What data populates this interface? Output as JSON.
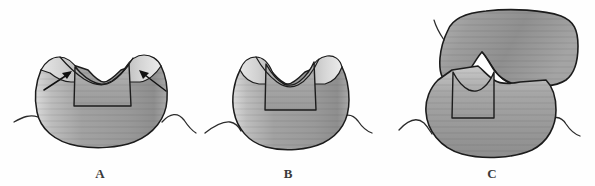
{
  "figure": {
    "background_color": "#fefefe",
    "width": 595,
    "height": 186,
    "style": "grayscale scanned line drawing"
  },
  "colors": {
    "outline": "#1c1c1c",
    "tooth_mid_gray": "#9a9a9a",
    "tooth_light_gray": "#d6d6d6",
    "tooth_dark_gray": "#7d7d7d",
    "prep_floor_gray": "#a8a8a8",
    "label_color": "#3a3a3a",
    "arrow_color": "#111111",
    "gingiva_line": "#2a2a2a"
  },
  "panels": [
    {
      "id": "panel-a",
      "label": "A",
      "label_x": 100,
      "label_y": 178,
      "caption": "Tooth with occlusal box preparation; arrows indicate remaining unsupported cusps",
      "arrows": [
        {
          "name": "left-cusp-arrow",
          "direction": "up-right",
          "tail_x": 44,
          "tail_y": 90,
          "tip_x": 72,
          "tip_y": 72
        },
        {
          "name": "right-cusp-arrow",
          "direction": "up-left",
          "tail_x": 165,
          "tail_y": 90,
          "tip_x": 139,
          "tip_y": 70
        }
      ],
      "has_gingiva": true
    },
    {
      "id": "panel-b",
      "label": "B",
      "label_x": 288,
      "label_y": 178,
      "caption": "Narrowed preparation with reduced cusps",
      "arrows": [],
      "has_gingiva": true
    },
    {
      "id": "panel-c",
      "label": "C",
      "label_x": 492,
      "label_y": 178,
      "caption": "Opposing tooth occluding against the prepared tooth",
      "arrows": [],
      "has_gingiva": true
    }
  ]
}
